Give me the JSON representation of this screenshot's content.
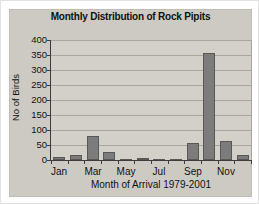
{
  "chart_data": {
    "type": "bar",
    "title": "Monthly Distribution of Rock Pipits",
    "xlabel": "Month of Arrival 1979-2001",
    "ylabel": "No of Birds",
    "categories": [
      "Jan",
      "Feb",
      "Mar",
      "Apr",
      "May",
      "Jun",
      "Jul",
      "Aug",
      "Sep",
      "Oct",
      "Nov",
      "Dec"
    ],
    "values": [
      10,
      18,
      80,
      28,
      3,
      5,
      2,
      4,
      55,
      355,
      62,
      17
    ],
    "x_labels_shown": [
      "Jan",
      "Mar",
      "May",
      "Jul",
      "Sep",
      "Nov"
    ],
    "ylim": [
      0,
      400
    ],
    "ytick_step": 50,
    "grid": "horizontal",
    "legend": "none",
    "colors": {
      "bar_fill": "#7c7c7c",
      "bar_border": "#585858",
      "chart_bg": "#cdcac4",
      "plot_bg": "#d3d0ca",
      "gridline": "#a9a69f",
      "axis": "#3c3c3c",
      "text": "#111111"
    }
  }
}
